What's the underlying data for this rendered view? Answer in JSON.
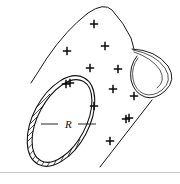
{
  "figure": {
    "caption": "",
    "background_color": "#ffffff",
    "ink_color": "#141414",
    "rule_color": "#c9c9c9"
  },
  "labels": {
    "radius": "R"
  },
  "charge_symbol": "+",
  "charges": [
    {
      "x": 94,
      "y": 24
    },
    {
      "x": 67,
      "y": 51
    },
    {
      "x": 105,
      "y": 46
    },
    {
      "x": 90,
      "y": 68
    },
    {
      "x": 118,
      "y": 69
    },
    {
      "x": 66,
      "y": 84
    },
    {
      "x": 70,
      "y": 83
    },
    {
      "x": 113,
      "y": 89
    },
    {
      "x": 134,
      "y": 96
    },
    {
      "x": 94,
      "y": 106
    },
    {
      "x": 129,
      "y": 118
    },
    {
      "x": 126,
      "y": 119
    },
    {
      "x": 110,
      "y": 141
    }
  ],
  "geometry": {
    "ring_outer": {
      "cx": 61,
      "cy": 121,
      "rx": 28,
      "ry": 49,
      "rotation": 28
    },
    "ring_inner": {
      "cx": 62,
      "cy": 121,
      "rx": 24,
      "ry": 45,
      "rotation": 28
    },
    "hatch_count": 64,
    "top_edge": "from ring top to apex then down to loop apex",
    "bottom_edge": "from ring bottom to loop bottom",
    "loop": "teardrop rolled edge at right end"
  },
  "radius_leader": {
    "from_x": 40,
    "from_y": 124,
    "dash_left_x2": 58,
    "text_x": 68,
    "text_y": 127,
    "dash_right_x1": 78,
    "dash_right_x2": 96
  }
}
